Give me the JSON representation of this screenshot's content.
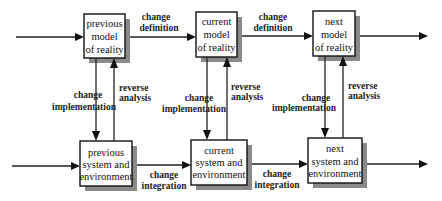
{
  "diagram": {
    "title": "",
    "nodes": {
      "prev_model": {
        "lines": [
          "previous",
          "model",
          "of reality"
        ]
      },
      "cur_model": {
        "lines": [
          "current",
          "model",
          "of reality"
        ]
      },
      "next_model": {
        "lines": [
          "next",
          "model",
          "of reality"
        ]
      },
      "prev_system": {
        "lines": [
          "previous",
          "system and",
          "environment"
        ]
      },
      "cur_system": {
        "lines": [
          "current",
          "system and",
          "environment"
        ]
      },
      "next_system": {
        "lines": [
          "next",
          "system and",
          "environment"
        ]
      }
    },
    "edges": {
      "def_1": {
        "from": "prev_model",
        "to": "cur_model",
        "lines": [
          "change",
          "definition"
        ]
      },
      "def_2": {
        "from": "cur_model",
        "to": "next_model",
        "lines": [
          "change",
          "definition"
        ]
      },
      "int_1": {
        "from": "prev_system",
        "to": "cur_system",
        "lines": [
          "change",
          "integration"
        ]
      },
      "int_2": {
        "from": "cur_system",
        "to": "next_system",
        "lines": [
          "change",
          "integration"
        ]
      },
      "impl_1": {
        "from": "prev_model",
        "to": "prev_system",
        "lines": [
          "change",
          "implementation"
        ]
      },
      "impl_2": {
        "from": "cur_model",
        "to": "cur_system",
        "lines": [
          "change",
          "implementation"
        ]
      },
      "impl_3": {
        "from": "next_model",
        "to": "next_system",
        "lines": [
          "change",
          "implementation"
        ]
      },
      "rev_1": {
        "from": "prev_system",
        "to": "prev_model",
        "lines": [
          "reverse",
          "analysis"
        ]
      },
      "rev_2": {
        "from": "cur_system",
        "to": "cur_model",
        "lines": [
          "reverse",
          "analysis"
        ]
      },
      "rev_3": {
        "from": "next_system",
        "to": "next_model",
        "lines": [
          "reverse",
          "analysis"
        ]
      },
      "in_model": {
        "from": "",
        "to": "prev_model"
      },
      "out_model": {
        "from": "next_model",
        "to": ""
      },
      "in_system": {
        "from": "",
        "to": "prev_system"
      },
      "out_system": {
        "from": "next_system",
        "to": ""
      }
    }
  }
}
